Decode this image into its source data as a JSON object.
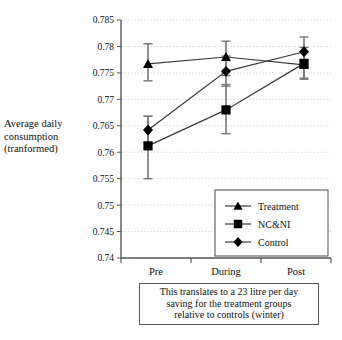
{
  "axis": {
    "y_title_line1": "Average daily",
    "y_title_line2": "consumption",
    "y_title_line3": "(tranformed)",
    "y_ticks": [
      "0.785",
      "0.78",
      "0.775",
      "0.77",
      "0.765",
      "0.76",
      "0.755",
      "0.75",
      "0.745",
      "0.74"
    ],
    "x_ticks": [
      "Pre",
      "During",
      "Post"
    ]
  },
  "legend": {
    "items": [
      {
        "label": "Treatment",
        "marker": "triangle-marker"
      },
      {
        "label": "NC&NI",
        "marker": "square-marker"
      },
      {
        "label": "Control",
        "marker": "diamond-marker"
      }
    ]
  },
  "caption": {
    "line1": "This translates to a 23 litre per day",
    "line2": "saving for the treatment groups",
    "line3": "relative to controls (winter)"
  },
  "colors": {
    "line": "#3a3a3a",
    "marker": "#000000",
    "error_bar": "#777777",
    "gridline": "#c9c9c9",
    "axis": "#555555",
    "box_border": "#5a5a5a"
  },
  "chart_data": {
    "type": "line",
    "title": "",
    "xlabel": "",
    "ylabel": "Average daily consumption (tranformed)",
    "categories": [
      "Pre",
      "During",
      "Post"
    ],
    "ylim": [
      0.74,
      0.785
    ],
    "ytick_step": 0.005,
    "grid": true,
    "legend_position": "bottom-right",
    "error_bars": true,
    "series": [
      {
        "name": "Treatment",
        "marker": "triangle",
        "values": [
          0.7767,
          0.778,
          0.7765
        ],
        "err_low": [
          0.7735,
          0.7745,
          0.774
        ],
        "err_high": [
          0.7805,
          0.781,
          0.779
        ]
      },
      {
        "name": "NC&NI",
        "marker": "square",
        "values": [
          0.7612,
          0.768,
          0.7768
        ],
        "err_low": [
          0.755,
          0.7635,
          0.7738
        ],
        "err_high": [
          0.7668,
          0.7728,
          0.7798
        ]
      },
      {
        "name": "Control",
        "marker": "diamond",
        "values": [
          0.7642,
          0.7753,
          0.779
        ],
        "err_low": [
          0.7618,
          0.7725,
          0.7762
        ],
        "err_high": [
          0.7668,
          0.7782,
          0.7818
        ]
      }
    ]
  }
}
